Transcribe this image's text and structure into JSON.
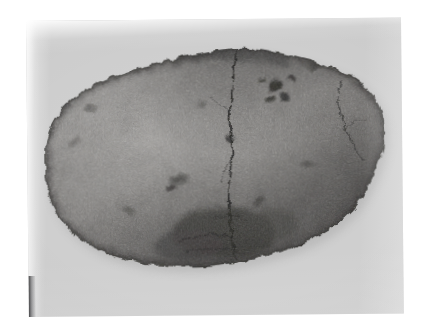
{
  "document": {
    "type": "photographic-plate",
    "medium": "black-and-white photograph",
    "page_background": "#ffffff",
    "plate_background": "#cfcfcf"
  },
  "plate": {
    "left": 26,
    "top": 21,
    "width": 375,
    "height": 296,
    "rotation_deg": -0.55,
    "highlight_band": "#f2f2f2",
    "edge_scuff": "#28282a"
  },
  "subject": {
    "name": "stone-artifact",
    "description": "oval ground-stone implement photographed in plan view",
    "shape": "elongated oval with irregular chipped margins",
    "orientation": "horizontal",
    "surface": "coarse granular weathered surface",
    "features": [
      "vertical medial crack",
      "secondary crack on right lobe",
      "dark pitted inclusions upper right",
      "dark abraded zone along lower centre",
      "chipped notch on left margin"
    ],
    "tones": {
      "lightest": "#a8a6a4",
      "mid": "#7a7876",
      "dark": "#4e4c4b",
      "darkest": "#2b2a29",
      "shadow": "#b4b4b4"
    },
    "bbox": {
      "x": 14,
      "y": 11,
      "width": 345,
      "height": 238
    }
  },
  "icons": {
    "photo": "photograph-icon",
    "stone": "stone-icon"
  }
}
